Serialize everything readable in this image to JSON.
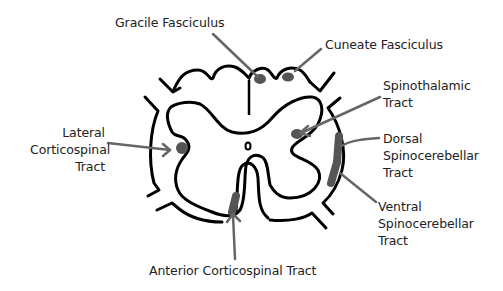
{
  "diagram": {
    "colors": {
      "outline": "#000000",
      "tract_fill": "#555555",
      "arrow": "#666666",
      "label_text": "#222222",
      "background": "#ffffff"
    },
    "labels": {
      "gracile_fasciculus": "Gracile Fasciculus",
      "cuneate_fasciculus": "Cuneate Fasciculus",
      "spinothalamic_tract": "Spinothalamic\nTract",
      "lateral_corticospinal_tract": "Lateral\nCorticospinal\nTract",
      "dorsal_spinocerebellar_tract": "Dorsal\nSpinocerebellar\nTract",
      "ventral_spinocerebellar_tract": "Ventral\nSpinocerebellar\nTract",
      "anterior_corticospinal_tract": "Anterior Corticospinal Tract"
    },
    "nodes": [
      {
        "id": "gracile_fasciculus",
        "label": "Gracile Fasciculus"
      },
      {
        "id": "cuneate_fasciculus",
        "label": "Cuneate Fasciculus"
      },
      {
        "id": "spinothalamic_tract",
        "label": "Spinothalamic Tract"
      },
      {
        "id": "lateral_corticospinal_tract",
        "label": "Lateral Corticospinal Tract"
      },
      {
        "id": "dorsal_spinocerebellar_tract",
        "label": "Dorsal Spinocerebellar Tract"
      },
      {
        "id": "ventral_spinocerebellar_tract",
        "label": "Ventral Spinocerebellar Tract"
      },
      {
        "id": "anterior_corticospinal_tract",
        "label": "Anterior Corticospinal Tract"
      }
    ]
  }
}
